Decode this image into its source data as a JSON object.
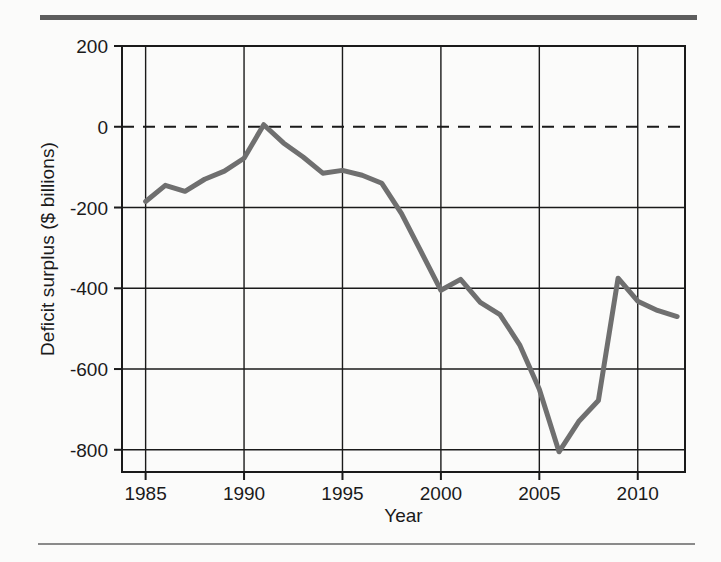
{
  "figure": {
    "rule_top_color": "#5d5d5d",
    "rule_bottom_color": "#8a8a8a",
    "background": "#fbfbfa"
  },
  "axis": {
    "y_title": "Deficit surplus ($ billions)",
    "x_title": "Year",
    "y_ticks": [
      "200",
      "0",
      "-200",
      "-400",
      "-600",
      "-800"
    ],
    "x_ticks": [
      "1985",
      "1990",
      "1995",
      "2000",
      "2005",
      "2010"
    ]
  },
  "chart_data": {
    "type": "line",
    "title": "",
    "subtitle": "",
    "xlabel": "Year",
    "ylabel": "Deficit surplus ($ billions)",
    "xlim": [
      1983.8,
      2012.4
    ],
    "ylim": [
      -855,
      200
    ],
    "y_ticks": [
      200,
      0,
      -200,
      -400,
      -600,
      -800
    ],
    "x_ticks": [
      1985,
      1990,
      1995,
      2000,
      2005,
      2010
    ],
    "grid": true,
    "legend": "none",
    "zero_line": {
      "value": 0,
      "style": "dashed",
      "color": "#1a1a1a"
    },
    "line_color": "#6f6f6f",
    "line_width": 5,
    "x": [
      1985,
      1986,
      1987,
      1988,
      1989,
      1990,
      1991,
      1992,
      1993,
      1994,
      1995,
      1996,
      1997,
      1998,
      1999,
      2000,
      2001,
      2002,
      2003,
      2004,
      2005,
      2006,
      2007,
      2008,
      2009,
      2010,
      2011,
      2012
    ],
    "values": [
      -185,
      -145,
      -160,
      -130,
      -110,
      -78,
      5,
      -40,
      -75,
      -115,
      -108,
      -120,
      -140,
      -215,
      -310,
      -405,
      -378,
      -435,
      -465,
      -540,
      -650,
      -805,
      -730,
      -678,
      -375,
      -432,
      -455,
      -470
    ],
    "series": [
      {
        "name": "Deficit surplus",
        "values": [
          -185,
          -145,
          -160,
          -130,
          -110,
          -78,
          5,
          -40,
          -75,
          -115,
          -108,
          -120,
          -140,
          -215,
          -310,
          -405,
          -378,
          -435,
          -465,
          -540,
          -650,
          -805,
          -730,
          -678,
          -375,
          -432,
          -455,
          -470
        ]
      }
    ]
  }
}
